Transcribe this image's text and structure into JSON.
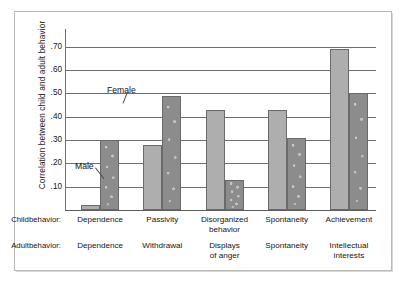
{
  "chart_data": {
    "type": "bar",
    "title": "",
    "xlabel": "",
    "ylabel": "Correlation between child and adult behavior",
    "ylim": [
      0,
      0.75
    ],
    "grid": true,
    "legend_position": "inline-annotation",
    "tick_labels": [
      ".70",
      ".60",
      ".50",
      ".40",
      ".30",
      ".20",
      ".10"
    ],
    "tick_values": [
      0.7,
      0.6,
      0.5,
      0.4,
      0.3,
      0.2,
      0.1
    ],
    "categories": [
      "Dependence",
      "Passivity",
      "Disorganized behavior",
      "Spontaneity",
      "Achievement"
    ],
    "series": [
      {
        "name": "Male",
        "color": "#aeaeae",
        "values": [
          0.02,
          0.28,
          0.43,
          0.43,
          0.69
        ]
      },
      {
        "name": "Female",
        "color": "#8c8c8c",
        "values": [
          0.3,
          0.49,
          0.13,
          0.31,
          0.5
        ]
      }
    ],
    "annotations": [
      {
        "label": "Female",
        "target_series": "Female",
        "target_category": "Dependence"
      },
      {
        "label": "Male",
        "target_series": "Male",
        "target_category": "Dependence"
      }
    ],
    "axis_rows": [
      {
        "key": "Child\nbehavior:",
        "key_line1": "Child",
        "key_line2": "behavior:",
        "values": [
          {
            "line1": "Dependence",
            "line2": ""
          },
          {
            "line1": "Passivity",
            "line2": ""
          },
          {
            "line1": "Disorganized",
            "line2": "behavior"
          },
          {
            "line1": "Spontaneity",
            "line2": ""
          },
          {
            "line1": "Achievement",
            "line2": ""
          }
        ]
      },
      {
        "key": "Adult\nbehavior:",
        "key_line1": "Adult",
        "key_line2": "behavior:",
        "values": [
          {
            "line1": "Dependence",
            "line2": ""
          },
          {
            "line1": "Withdrawal",
            "line2": ""
          },
          {
            "line1": "Displays",
            "line2": "of anger"
          },
          {
            "line1": "Spontaneity",
            "line2": ""
          },
          {
            "line1": "Intellectual",
            "line2": "interests"
          }
        ]
      }
    ]
  }
}
